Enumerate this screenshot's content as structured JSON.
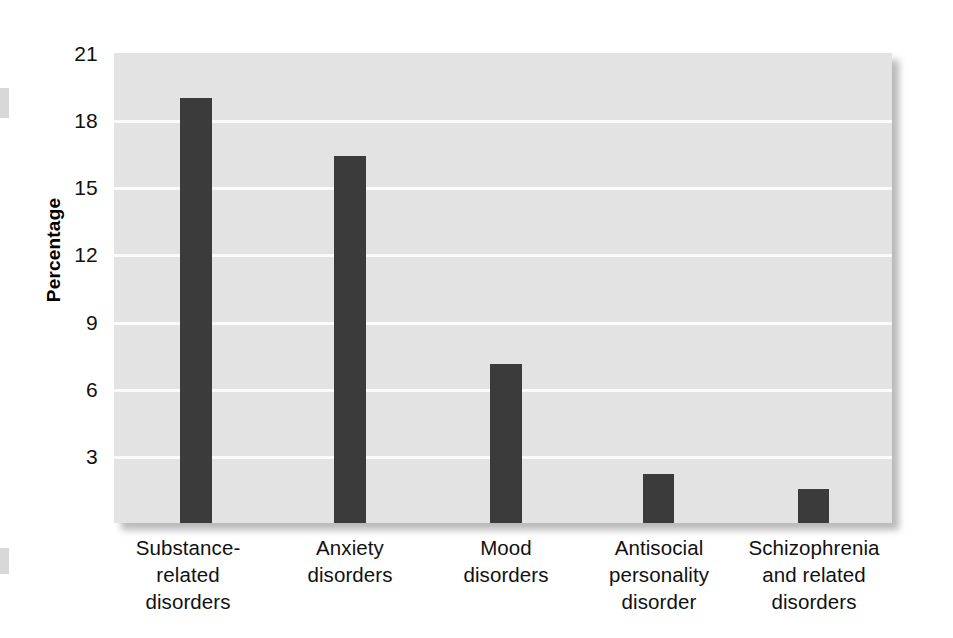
{
  "chart_data": {
    "type": "bar",
    "title": "",
    "xlabel": "",
    "ylabel": "Percentage",
    "categories": [
      "Substance-\nrelated\ndisorders",
      "Anxiety\ndisorders",
      "Mood\ndisorders",
      "Antisocial\npersonality\ndisorder",
      "Schizophrenia\nand related\ndisorders"
    ],
    "values": [
      19.0,
      16.4,
      7.1,
      2.2,
      1.5
    ],
    "ylim": [
      0,
      21
    ],
    "yticks": [
      3,
      6,
      9,
      12,
      15,
      18,
      21
    ],
    "ytick_labels": [
      "3",
      "6",
      "9",
      "12",
      "15",
      "18",
      "21"
    ],
    "grid": true,
    "legend": "none",
    "bar_color": "#3b3b3b",
    "plot_background": "#e3e3e3",
    "gridline_color": "#fbfbfb"
  },
  "axis": {
    "y_title": "Percentage",
    "ticks": [
      {
        "label": "21",
        "value": 21
      },
      {
        "label": "18",
        "value": 18
      },
      {
        "label": "15",
        "value": 15
      },
      {
        "label": "12",
        "value": 12
      },
      {
        "label": "9",
        "value": 9
      },
      {
        "label": "6",
        "value": 6
      },
      {
        "label": "3",
        "value": 3
      }
    ]
  },
  "bars": [
    {
      "name": "substance-related-disorders",
      "value": 19.0,
      "line1": "Substance-",
      "line2": "related",
      "line3": "disorders"
    },
    {
      "name": "anxiety-disorders",
      "value": 16.4,
      "line1": "Anxiety",
      "line2": "disorders",
      "line3": ""
    },
    {
      "name": "mood-disorders",
      "value": 7.1,
      "line1": "Mood",
      "line2": "disorders",
      "line3": ""
    },
    {
      "name": "antisocial-personality-disorder",
      "value": 2.2,
      "line1": "Antisocial",
      "line2": "personality",
      "line3": "disorder"
    },
    {
      "name": "schizophrenia-and-related-disorders",
      "value": 1.5,
      "line1": "Schizophrenia",
      "line2": "and related",
      "line3": "disorders"
    }
  ]
}
